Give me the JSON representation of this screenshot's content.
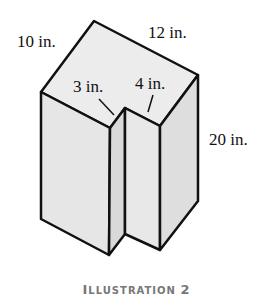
{
  "figure": {
    "labels": {
      "depth": "10 in.",
      "width": "12 in.",
      "notch_width": "3 in.",
      "notch_depth": "4 in.",
      "height": "20 in."
    },
    "caption": "Illustration 2",
    "caption_parts": {
      "first_letter": "I",
      "rest": "LLUSTRATION",
      "number": "2"
    },
    "colors": {
      "outline": "#111111",
      "face_light": "#ececec",
      "face_mid": "#e2e2e2",
      "face_dark": "#d6d6d6",
      "caption": "#777777"
    }
  }
}
